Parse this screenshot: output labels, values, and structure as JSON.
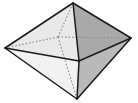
{
  "figure": {
    "shape_name": "octahedron",
    "canvas": {
      "width": 138,
      "height": 103,
      "background": "#ffffff"
    },
    "style": {
      "solid_edge_color": "#1a1a1a",
      "solid_edge_width": 1.5,
      "hidden_edge_color": "#8c8c8c",
      "hidden_edge_width": 1.1,
      "hidden_edge_dash": "1.6 1.9"
    },
    "vertices": [
      {
        "id": "top",
        "label": "top apex",
        "x": 73,
        "y": 3,
        "hidden": false
      },
      {
        "id": "bottom",
        "label": "bottom apex",
        "x": 77,
        "y": 99,
        "hidden": false
      },
      {
        "id": "left",
        "label": "left equator",
        "x": 5,
        "y": 48,
        "hidden": false
      },
      {
        "id": "right",
        "label": "right equator",
        "x": 131,
        "y": 38,
        "hidden": false
      },
      {
        "id": "front",
        "label": "front equator",
        "x": 79,
        "y": 61,
        "hidden": false
      },
      {
        "id": "back",
        "label": "back equator",
        "x": 58,
        "y": 37,
        "hidden": true
      }
    ],
    "faces": [
      {
        "id": "top-left-front",
        "label": "upper left front face",
        "points": "73,3 5,48 79,61",
        "fill": "#e9e9e9"
      },
      {
        "id": "top-right-front",
        "label": "upper right front face",
        "points": "73,3 79,61 131,38",
        "fill": "#a9a9a9"
      },
      {
        "id": "bottom-left-front",
        "label": "lower left front face",
        "points": "5,48 77,99 79,61",
        "fill": "#f2f2f2"
      },
      {
        "id": "bottom-right-front",
        "label": "lower right front face",
        "points": "79,61 77,99 131,38",
        "fill": "#b9b9b9"
      }
    ],
    "solid_edges": [
      {
        "id": "top-left",
        "label": "top to left",
        "x1": 73,
        "y1": 3,
        "x2": 5,
        "y2": 48
      },
      {
        "id": "top-right",
        "label": "top to right",
        "x1": 73,
        "y1": 3,
        "x2": 131,
        "y2": 38
      },
      {
        "id": "top-front",
        "label": "top to front",
        "x1": 73,
        "y1": 3,
        "x2": 79,
        "y2": 61
      },
      {
        "id": "left-bottom",
        "label": "left to bottom",
        "x1": 5,
        "y1": 48,
        "x2": 77,
        "y2": 99
      },
      {
        "id": "right-bottom",
        "label": "right to bottom",
        "x1": 131,
        "y1": 38,
        "x2": 77,
        "y2": 99
      },
      {
        "id": "front-bottom",
        "label": "front to bottom",
        "x1": 79,
        "y1": 61,
        "x2": 77,
        "y2": 99
      },
      {
        "id": "left-front",
        "label": "left to front",
        "x1": 5,
        "y1": 48,
        "x2": 79,
        "y2": 61
      },
      {
        "id": "front-right",
        "label": "front to right",
        "x1": 79,
        "y1": 61,
        "x2": 131,
        "y2": 38
      }
    ],
    "hidden_edges": [
      {
        "id": "back-top",
        "label": "back to top",
        "x1": 58,
        "y1": 37,
        "x2": 73,
        "y2": 3
      },
      {
        "id": "back-bottom",
        "label": "back to bottom",
        "x1": 58,
        "y1": 37,
        "x2": 77,
        "y2": 99
      },
      {
        "id": "back-left",
        "label": "back to left",
        "x1": 58,
        "y1": 37,
        "x2": 5,
        "y2": 48
      },
      {
        "id": "back-right",
        "label": "back to right",
        "x1": 58,
        "y1": 37,
        "x2": 131,
        "y2": 38
      }
    ]
  }
}
